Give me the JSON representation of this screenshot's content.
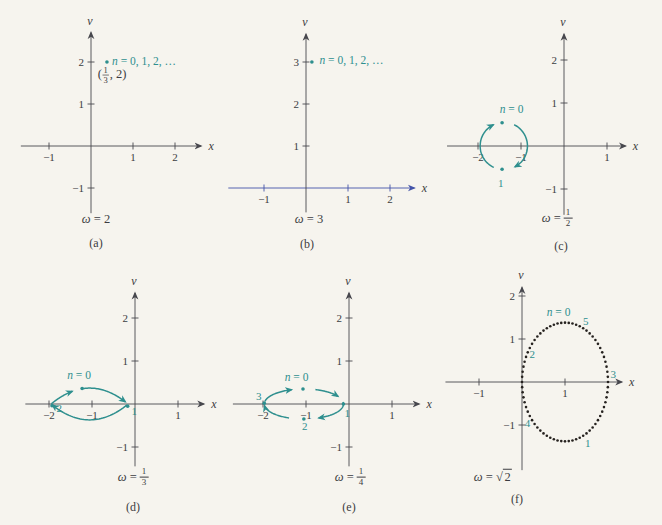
{
  "figure": {
    "omega_symbol": "ω",
    "equals": " = ",
    "sqrt_symbol": "√",
    "colors": {
      "background": "#f6f4ee",
      "ink": "#3c3c41",
      "axis": "#47474d",
      "teal": "#2e8f8e",
      "blue_axis": "#4353a8",
      "dot": "#26221f"
    }
  },
  "chart_data": [
    {
      "id": "a",
      "type": "scatter",
      "caption": "(a)",
      "omega": {
        "kind": "plain",
        "value": "2"
      },
      "box": {
        "left": 0,
        "top": 0,
        "width": 225,
        "height": 260
      },
      "origin": {
        "x": 91,
        "y": 146
      },
      "unit": 42,
      "x_axis": {
        "min": -1.67,
        "max": 2.62,
        "label": "x",
        "ticks": [
          -1,
          1,
          2
        ],
        "color": "axis"
      },
      "y_axis": {
        "min": -1.6,
        "max": 2.7,
        "label": "v",
        "ticks": [
          -1,
          1,
          2
        ]
      },
      "points": [
        {
          "x": 0.38,
          "y": 2.0
        }
      ],
      "labels": [
        {
          "kind": "nseries",
          "x": 0.5,
          "y": 2.03,
          "anchor": "start",
          "text_it": "n",
          "text": " = 0, 1, 2, …"
        },
        {
          "kind": "point_frac",
          "x": 0.16,
          "y": 1.72,
          "pre": "(",
          "num": "1",
          "den": "3",
          "post": ", 2)"
        }
      ],
      "curve": null,
      "omega_pos": {
        "x": 96,
        "y": 219
      },
      "caption_pos": {
        "x": 96,
        "y": 243
      }
    },
    {
      "id": "b",
      "type": "scatter",
      "caption": "(b)",
      "omega": {
        "kind": "plain",
        "value": "3"
      },
      "box": {
        "left": 225,
        "top": 0,
        "width": 220,
        "height": 260
      },
      "origin": {
        "x": 81,
        "y": 188
      },
      "unit": 42,
      "x_axis": {
        "min": -1.85,
        "max": 2.58,
        "label": "x",
        "ticks": [
          -1,
          1,
          2
        ],
        "color": "blue_axis"
      },
      "y_axis": {
        "min": -0.58,
        "max": 3.66,
        "label": "v",
        "ticks": [
          1,
          2,
          3
        ]
      },
      "points": [
        {
          "x": 0.14,
          "y": 3.0
        }
      ],
      "labels": [
        {
          "kind": "nseries",
          "x": 0.32,
          "y": 3.04,
          "anchor": "start",
          "text_it": "n",
          "text": " = 0, 1, 2, …"
        }
      ],
      "curve": null,
      "omega_pos": {
        "x": 309,
        "y": 219
      },
      "caption_pos": {
        "x": 307,
        "y": 244
      }
    },
    {
      "id": "c",
      "type": "line",
      "caption": "(c)",
      "omega": {
        "kind": "frac",
        "num": "1",
        "den": "2"
      },
      "box": {
        "left": 445,
        "top": 0,
        "width": 217,
        "height": 260
      },
      "origin": {
        "x": 119,
        "y": 146
      },
      "unit": 43,
      "x_axis": {
        "min": -2.72,
        "max": 1.43,
        "label": "x",
        "ticks": [
          -2,
          -1,
          1
        ],
        "color": "axis"
      },
      "y_axis": {
        "min": -1.6,
        "max": 2.6,
        "label": "v",
        "ticks": [
          -1,
          1,
          2
        ]
      },
      "points": [
        {
          "x": -1.44,
          "y": 0.54
        },
        {
          "x": -1.44,
          "y": -0.54
        }
      ],
      "labels": [
        {
          "kind": "nseries",
          "x": -1.22,
          "y": 0.85,
          "anchor": "middle",
          "text_it": "n",
          "text": " = 0"
        },
        {
          "kind": "plain",
          "x": -1.47,
          "y": -0.86,
          "anchor": "middle",
          "text": "1"
        }
      ],
      "curve": {
        "type": "arc",
        "cx": -1.4,
        "cy": 0,
        "rx": 0.55,
        "ry": 0.55,
        "segments": [
          {
            "a0": 245,
            "a1": 116,
            "arrow": true
          },
          {
            "a0": 64,
            "a1": -62,
            "arrow": true
          }
        ]
      },
      "omega_pos": {
        "x": 557,
        "y": 219
      },
      "caption_pos": {
        "x": 561,
        "y": 246
      }
    },
    {
      "id": "d",
      "type": "line",
      "caption": "(d)",
      "omega": {
        "kind": "frac",
        "num": "1",
        "den": "3"
      },
      "box": {
        "left": 0,
        "top": 262,
        "width": 225,
        "height": 263
      },
      "origin": {
        "x": 135,
        "y": 142
      },
      "unit": 43,
      "x_axis": {
        "min": -2.55,
        "max": 1.6,
        "label": "x",
        "ticks": [
          -2,
          -1,
          1
        ],
        "color": "axis"
      },
      "y_axis": {
        "min": -1.45,
        "max": 2.58,
        "label": "v",
        "ticks": [
          -1,
          1,
          2
        ]
      },
      "points": [
        {
          "x": -1.23,
          "y": 0.36
        },
        {
          "x": -1.93,
          "y": -0.04
        },
        {
          "x": -0.17,
          "y": -0.05
        }
      ],
      "labels": [
        {
          "kind": "nseries",
          "x": -1.3,
          "y": 0.67,
          "anchor": "middle",
          "text_it": "n",
          "text": " = 0"
        },
        {
          "kind": "plain",
          "x": -1.76,
          "y": -0.09,
          "anchor": "middle",
          "text": "2"
        },
        {
          "kind": "plain",
          "x": -0.02,
          "y": -0.17,
          "anchor": "middle",
          "text": "1"
        }
      ],
      "curve": {
        "type": "lens",
        "cx": -1.055,
        "a": 0.895,
        "h": 0.37,
        "segments": [
          {
            "side": "top",
            "u0": -0.995,
            "u1": -0.45,
            "arrow": true
          },
          {
            "side": "top",
            "u0": -0.17,
            "u1": 0.93,
            "arrow": true
          },
          {
            "side": "bottom",
            "u0": 0.97,
            "u1": -0.97,
            "arrow": true
          }
        ]
      },
      "omega_pos": {
        "x": 133,
        "y": 478
      },
      "caption_pos": {
        "x": 133,
        "y": 507
      }
    },
    {
      "id": "e",
      "type": "line",
      "caption": "(e)",
      "omega": {
        "kind": "frac",
        "num": "1",
        "den": "4"
      },
      "box": {
        "left": 225,
        "top": 262,
        "width": 220,
        "height": 263
      },
      "origin": {
        "x": 124,
        "y": 142
      },
      "unit": 43,
      "x_axis": {
        "min": -2.7,
        "max": 1.63,
        "label": "x",
        "ticks": [
          -2,
          -1,
          1
        ],
        "color": "axis"
      },
      "y_axis": {
        "min": -1.45,
        "max": 2.58,
        "label": "v",
        "ticks": [
          -1,
          1,
          2
        ]
      },
      "points": [
        {
          "x": -1.07,
          "y": 0.35
        },
        {
          "x": -0.13,
          "y": 0.0
        },
        {
          "x": -1.05,
          "y": -0.35
        },
        {
          "x": -1.97,
          "y": 0.02
        }
      ],
      "labels": [
        {
          "kind": "nseries",
          "x": -1.22,
          "y": 0.62,
          "anchor": "middle",
          "text_it": "n",
          "text": " = 0"
        },
        {
          "kind": "plain",
          "x": -2.1,
          "y": 0.18,
          "anchor": "middle",
          "text": "3"
        },
        {
          "kind": "plain",
          "x": -0.04,
          "y": -0.22,
          "anchor": "middle",
          "text": "1"
        },
        {
          "kind": "plain",
          "x": -1.03,
          "y": -0.52,
          "anchor": "middle",
          "text": "2"
        }
      ],
      "curve": {
        "type": "arc",
        "cx": -1.05,
        "cy": 0,
        "rx": 0.92,
        "ry": 0.35,
        "segments": [
          {
            "a0": 170,
            "a1": 108,
            "arrow": true
          },
          {
            "a0": 73,
            "a1": 30,
            "arrow": true
          },
          {
            "a0": 8,
            "a1": -68,
            "arrow": true
          },
          {
            "a0": -112,
            "a1": -174,
            "arrow": true
          }
        ]
      },
      "omega_pos": {
        "x": 350,
        "y": 478
      },
      "caption_pos": {
        "x": 349,
        "y": 507
      }
    },
    {
      "id": "f",
      "type": "scatter",
      "caption": "(f)",
      "omega": {
        "kind": "sqrt",
        "value": "2"
      },
      "box": {
        "left": 445,
        "top": 262,
        "width": 217,
        "height": 263
      },
      "origin": {
        "x": 77,
        "y": 120
      },
      "unit": 43,
      "x_axis": {
        "min": -1.78,
        "max": 2.32,
        "label": "x",
        "ticks": [
          -1,
          1
        ],
        "color": "axis"
      },
      "y_axis": {
        "min": -2.05,
        "max": 2.2,
        "label": "v",
        "ticks": [
          -1,
          1,
          2
        ]
      },
      "points": [],
      "labels": [
        {
          "kind": "nseries",
          "x": 0.85,
          "y": 1.63,
          "anchor": "middle",
          "text_it": "n",
          "text": " = 0"
        },
        {
          "kind": "plain",
          "x": 1.48,
          "y": 1.41,
          "anchor": "middle",
          "text": "5"
        },
        {
          "kind": "plain",
          "x": 0.24,
          "y": 0.65,
          "anchor": "middle",
          "text": "2"
        },
        {
          "kind": "plain",
          "x": 2.12,
          "y": 0.19,
          "anchor": "middle",
          "text": "3"
        },
        {
          "kind": "plain",
          "x": 0.13,
          "y": -0.96,
          "anchor": "middle",
          "text": "4"
        },
        {
          "kind": "plain",
          "x": 1.53,
          "y": -1.42,
          "anchor": "middle",
          "text": "1"
        }
      ],
      "curve": {
        "type": "dots",
        "cx": 1.0,
        "cy": 0.0,
        "rx": 1.0,
        "ry": 1.38,
        "count": 72
      },
      "omega_pos": {
        "x": 493,
        "y": 477
      },
      "caption_pos": {
        "x": 517,
        "y": 499
      }
    }
  ]
}
